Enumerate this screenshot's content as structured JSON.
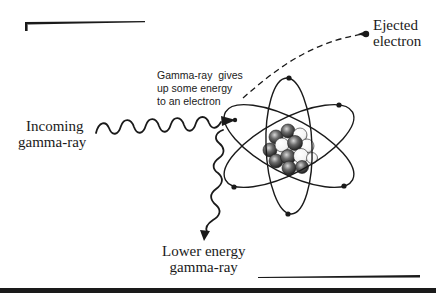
{
  "diagram": {
    "labels": {
      "incoming": [
        "Incoming",
        "gamma-ray"
      ],
      "interaction": [
        "Gamma-ray  gives",
        "up some energy",
        "to an electron"
      ],
      "ejected": [
        "Ejected",
        "electron"
      ],
      "scattered": [
        "Lower energy",
        "gamma-ray"
      ]
    },
    "colors": {
      "ink": "#1a1a1a",
      "background": "#ffffff",
      "nucleus_dark": "#3a3a3a",
      "nucleus_light": "#f4f4f4"
    },
    "elements": {
      "atom": "atom with nucleus and three elliptical electron orbits",
      "incoming_wave": "wavy-arrow",
      "scattered_wave": "wavy-arrow",
      "ejected_path": "dashed-arc",
      "electrons_on_orbits": 6
    }
  }
}
